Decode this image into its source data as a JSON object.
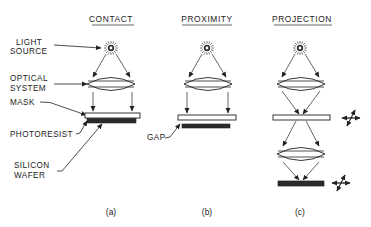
{
  "figure": {
    "panels": [
      {
        "id": "a",
        "title": "CONTACT",
        "caption": "(a)"
      },
      {
        "id": "b",
        "title": "PROXIMITY",
        "caption": "(b)"
      },
      {
        "id": "c",
        "title": "PROJECTION",
        "caption": "(c)"
      }
    ],
    "labels": {
      "light_source_1": "LIGHT",
      "light_source_2": "SOURCE",
      "optical_system_1": "OPTICAL",
      "optical_system_2": "SYSTEM",
      "mask": "MASK",
      "photoresist": "PHOTORESIST",
      "silicon_wafer_1": "SILICON",
      "silicon_wafer_2": "WAFER",
      "gap": "GAP"
    },
    "icons": [
      "light-source-icon",
      "lens-icon",
      "mask-plate",
      "wafer-plate",
      "xy-translation-icon"
    ],
    "colors": {
      "ink": "#222222",
      "background": "#ffffff",
      "wafer_fill": "#2a2a2a"
    }
  }
}
